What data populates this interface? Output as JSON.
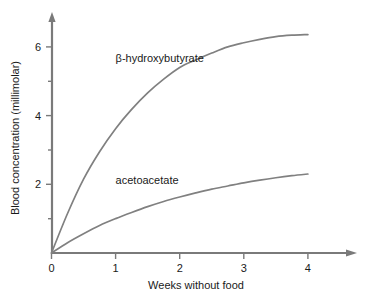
{
  "chart_data": {
    "type": "line",
    "title": "",
    "xlabel": "Weeks without food",
    "ylabel": "Blood concentration (millimolar)",
    "xlim": [
      0,
      4.6
    ],
    "ylim": [
      0,
      7.0
    ],
    "grid": false,
    "legend_position": "inline-annotations",
    "x_ticks": [
      0,
      1,
      2,
      3,
      4
    ],
    "x_tick_labels": [
      "0",
      "1",
      "2",
      "3",
      "4"
    ],
    "y_ticks": [
      0,
      2,
      4,
      6
    ],
    "y_tick_labels": [
      "0",
      "2",
      "4",
      "6"
    ],
    "y_minor_ticks": [
      1,
      3,
      5
    ],
    "x": [
      0,
      0.25,
      0.5,
      0.75,
      1,
      1.25,
      1.5,
      1.75,
      2,
      2.25,
      2.5,
      2.75,
      3,
      3.25,
      3.5,
      3.75,
      4
    ],
    "series": [
      {
        "name": "β-hydroxybutyrate",
        "color": "#808080",
        "values": [
          0,
          1.15,
          2.15,
          2.95,
          3.62,
          4.18,
          4.66,
          5.06,
          5.4,
          5.62,
          5.82,
          6.0,
          6.12,
          6.22,
          6.3,
          6.34,
          6.36
        ],
        "label_x": 1.0,
        "label_y": 5.55
      },
      {
        "name": "acetoacetate",
        "color": "#808080",
        "values": [
          0,
          0.3,
          0.56,
          0.8,
          1.0,
          1.18,
          1.35,
          1.5,
          1.63,
          1.75,
          1.86,
          1.95,
          2.04,
          2.12,
          2.19,
          2.25,
          2.3
        ],
        "label_x": 1.0,
        "label_y": 2.0
      }
    ],
    "annotations": [
      {
        "text": "β-hydroxybutyrate",
        "x": 1.0,
        "y": 5.55
      },
      {
        "text": "acetoacetate",
        "x": 1.0,
        "y": 2.0
      }
    ]
  },
  "axes": {
    "x_axis_name": "Weeks without food",
    "y_axis_name": "Blood concentration (millimolar)"
  }
}
